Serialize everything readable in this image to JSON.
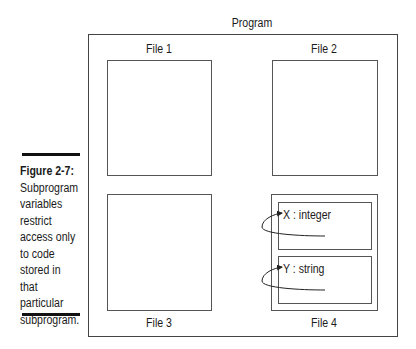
{
  "diagram": {
    "title": "Program",
    "files": [
      {
        "label": "File 1"
      },
      {
        "label": "File 2"
      },
      {
        "label": "File 3"
      },
      {
        "label": "File 4",
        "subprograms": [
          {
            "variable": "X : integer"
          },
          {
            "variable": "Y : string"
          }
        ]
      }
    ]
  },
  "caption": {
    "figure": "Figure 2-7:",
    "lines": [
      "Subprogram",
      "variables",
      "restrict",
      "access only",
      "to code",
      "stored in",
      "that",
      "particular",
      "subprogram."
    ]
  }
}
